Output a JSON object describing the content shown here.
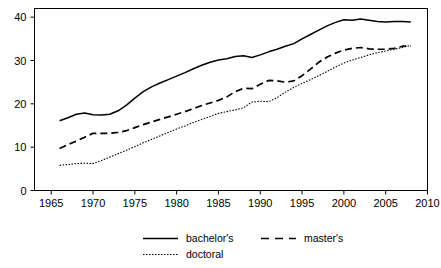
{
  "chart_data": {
    "type": "line",
    "title": "",
    "subtitle": "",
    "xlabel": "",
    "ylabel": "",
    "xlim": [
      1963,
      2010
    ],
    "ylim": [
      0,
      42
    ],
    "grid": false,
    "legend_position": "bottom",
    "x_ticks": [
      1965,
      1970,
      1975,
      1980,
      1985,
      1990,
      1995,
      2000,
      2005,
      2010
    ],
    "y_ticks": [
      0,
      10,
      20,
      30,
      40
    ],
    "x": [
      1966,
      1967,
      1968,
      1969,
      1970,
      1971,
      1972,
      1973,
      1974,
      1975,
      1976,
      1977,
      1978,
      1979,
      1980,
      1981,
      1982,
      1983,
      1984,
      1985,
      1986,
      1987,
      1988,
      1989,
      1990,
      1991,
      1992,
      1993,
      1994,
      1995,
      1996,
      1997,
      1998,
      1999,
      2000,
      2001,
      2002,
      2003,
      2004,
      2005,
      2006,
      2007,
      2008
    ],
    "series": [
      {
        "name": "bachelor's",
        "style": "solid",
        "values": [
          16.1,
          16.8,
          17.6,
          17.9,
          17.5,
          17.4,
          17.6,
          18.4,
          19.7,
          21.3,
          22.8,
          23.9,
          24.8,
          25.6,
          26.4,
          27.2,
          28.1,
          28.9,
          29.6,
          30.1,
          30.4,
          30.9,
          31.1,
          30.7,
          31.3,
          32.0,
          32.6,
          33.3,
          33.9,
          35.0,
          36.0,
          37.0,
          38.0,
          38.8,
          39.4,
          39.3,
          39.6,
          39.3,
          39.0,
          38.9,
          39.0,
          39.0,
          38.9
        ]
      },
      {
        "name": "master's",
        "style": "dashed",
        "values": [
          9.7,
          10.6,
          11.4,
          12.3,
          13.2,
          13.2,
          13.2,
          13.4,
          13.8,
          14.5,
          15.2,
          15.8,
          16.4,
          17.0,
          17.6,
          18.2,
          18.9,
          19.6,
          20.2,
          20.8,
          21.6,
          22.8,
          23.6,
          23.5,
          24.5,
          25.4,
          25.3,
          25.0,
          25.3,
          26.5,
          28.0,
          29.6,
          30.8,
          31.7,
          32.4,
          32.8,
          33.0,
          32.7,
          32.6,
          32.6,
          32.8,
          33.3,
          33.4
        ]
      },
      {
        "name": "doctoral",
        "style": "dotted",
        "values": [
          5.8,
          6.0,
          6.2,
          6.3,
          6.2,
          6.9,
          7.7,
          8.5,
          9.3,
          10.1,
          11.0,
          11.8,
          12.6,
          13.4,
          14.2,
          14.9,
          15.7,
          16.4,
          17.1,
          17.8,
          18.2,
          18.6,
          19.1,
          20.4,
          20.6,
          20.5,
          21.4,
          22.7,
          23.8,
          24.7,
          25.6,
          26.5,
          27.5,
          28.5,
          29.4,
          30.1,
          30.7,
          31.3,
          31.8,
          32.2,
          32.6,
          33.0,
          33.5
        ]
      }
    ]
  },
  "legend": {
    "entries": [
      {
        "label": "bachelor's",
        "style": "solid"
      },
      {
        "label": "master's",
        "style": "dashed"
      },
      {
        "label": "doctoral",
        "style": "dotted"
      }
    ]
  },
  "colors": {
    "line": "#000000",
    "axis": "#000000",
    "background": "#ffffff"
  }
}
